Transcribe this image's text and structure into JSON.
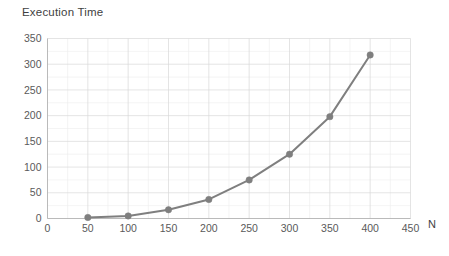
{
  "chart_data": {
    "type": "line",
    "title": "Execution Time",
    "xlabel": "N",
    "ylabel": "",
    "x": [
      50,
      100,
      150,
      200,
      250,
      300,
      350,
      400
    ],
    "values": [
      2,
      5,
      17,
      37,
      75,
      125,
      198,
      318
    ],
    "series": [
      {
        "name": "Execution Time",
        "x": [
          50,
          100,
          150,
          200,
          250,
          300,
          350,
          400
        ],
        "values": [
          2,
          5,
          17,
          37,
          75,
          125,
          198,
          318
        ]
      }
    ],
    "xlim": [
      0,
      450
    ],
    "ylim": [
      0,
      350
    ],
    "xticks": [
      0,
      50,
      100,
      150,
      200,
      250,
      300,
      350,
      400,
      450
    ],
    "yticks": [
      0,
      50,
      100,
      150,
      200,
      250,
      300,
      350
    ],
    "xtick_labels": [
      "0",
      "50",
      "100",
      "150",
      "200",
      "250",
      "300",
      "350",
      "400",
      "450"
    ],
    "ytick_labels": [
      "0",
      "50",
      "100",
      "150",
      "200",
      "250",
      "300",
      "350"
    ],
    "grid": true,
    "grid_minor": true,
    "legend": false,
    "legend_position": "none",
    "marker": "circle",
    "line_color": "#7f7f7f",
    "marker_color": "#7f7f7f",
    "grid_color": "#d8d8d8",
    "minor_grid_color": "#ededed",
    "axis_color": "#b4b4b4",
    "text_color": "#5a5a5a",
    "title_color": "#3f3f3f",
    "background": "#ffffff"
  }
}
